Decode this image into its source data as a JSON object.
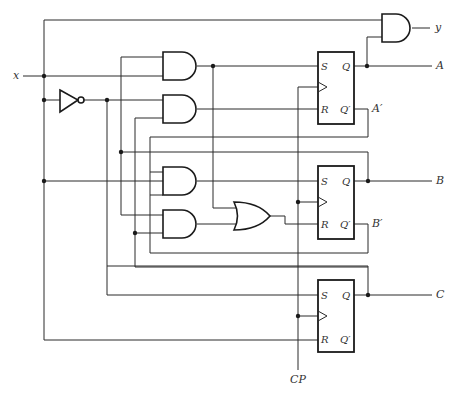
{
  "diagram": {
    "type": "sequential logic circuit",
    "inputs": {
      "x": "x",
      "clock": "CP"
    },
    "outputs": {
      "y": "y",
      "A": "A",
      "A_prime": "A′",
      "B": "B",
      "B_prime": "B′",
      "C": "C"
    },
    "flipflops": [
      {
        "id": "A",
        "pins": {
          "s": "S",
          "r": "R",
          "q": "Q",
          "qn": "Q′"
        }
      },
      {
        "id": "B",
        "pins": {
          "s": "S",
          "r": "R",
          "q": "Q",
          "qn": "Q′"
        }
      },
      {
        "id": "C",
        "pins": {
          "s": "S",
          "r": "R",
          "q": "Q",
          "qn": "Q′"
        }
      }
    ],
    "gates": [
      "AND (output y)",
      "AND 1",
      "AND 2",
      "AND 3",
      "AND 4",
      "OR",
      "NOT (inverter)"
    ]
  }
}
